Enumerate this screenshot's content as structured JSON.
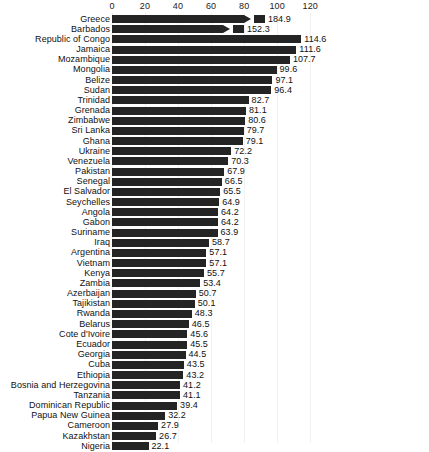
{
  "chart_data": {
    "type": "bar",
    "orientation": "horizontal",
    "title": "",
    "subtitle": "",
    "xlabel": "",
    "ylabel": "",
    "xlim": [
      0,
      130
    ],
    "ticks": [
      0,
      20,
      40,
      60,
      80,
      100,
      120
    ],
    "tick_labels": [
      "0",
      "20",
      "40",
      "60",
      "80",
      "100",
      "120"
    ],
    "grid": true,
    "grid_axis": "x",
    "legend": false,
    "axis_break": {
      "present": true,
      "applies_to": [
        "Greece",
        "Barbados"
      ],
      "note": "bars exceeding axis maximum are drawn truncated with an arrowhead and a detached end block"
    },
    "bar_color": "#242424",
    "categories": [
      "Greece",
      "Barbados",
      "Republic of Congo",
      "Jamaica",
      "Mozambique",
      "Mongolia",
      "Belize",
      "Sudan",
      "Trinidad",
      "Grenada",
      "Zimbabwe",
      "Sri Lanka",
      "Ghana",
      "Ukraine",
      "Venezuela",
      "Pakistan",
      "Senegal",
      "El Salvador",
      "Seychelles",
      "Angola",
      "Gabon",
      "Suriname",
      "Iraq",
      "Argentina",
      "Vietnam",
      "Kenya",
      "Zambia",
      "Azerbaijan",
      "Tajikistan",
      "Rwanda",
      "Belarus",
      "Cote d'Ivoire",
      "Ecuador",
      "Georgia",
      "Cuba",
      "Ethiopia",
      "Bosnia and Herzegovina",
      "Tanzania",
      "Dominican Republic",
      "Papua New Guinea",
      "Cameroon",
      "Kazakhstan",
      "Nigeria"
    ],
    "values": [
      184.9,
      152.3,
      114.6,
      111.6,
      107.7,
      99.6,
      97.1,
      96.4,
      82.7,
      81.1,
      80.6,
      79.7,
      79.1,
      72.2,
      70.3,
      67.9,
      66.5,
      65.5,
      64.9,
      64.2,
      64.2,
      63.9,
      58.7,
      57.1,
      57.1,
      55.7,
      53.4,
      50.7,
      50.1,
      48.3,
      46.5,
      45.6,
      45.5,
      44.5,
      43.5,
      43.2,
      41.2,
      41.1,
      39.4,
      32.2,
      27.9,
      26.7,
      22.1
    ],
    "value_labels": [
      "184.9",
      "152.3",
      "114.6",
      "111.6",
      "107.7",
      "99.6",
      "97.1",
      "96.4",
      "82.7",
      "81.1",
      "80.6",
      "79.7",
      "79.1",
      "72.2",
      "70.3",
      "67.9",
      "66.5",
      "65.5",
      "64.9",
      "64.2",
      "64.2",
      "63.9",
      "58.7",
      "57.1",
      "57.1",
      "55.7",
      "53.4",
      "50.7",
      "50.1",
      "48.3",
      "46.5",
      "45.6",
      "45.5",
      "44.5",
      "43.5",
      "43.2",
      "41.2",
      "41.1",
      "39.4",
      "32.2",
      "27.9",
      "26.7",
      "22.1"
    ]
  }
}
